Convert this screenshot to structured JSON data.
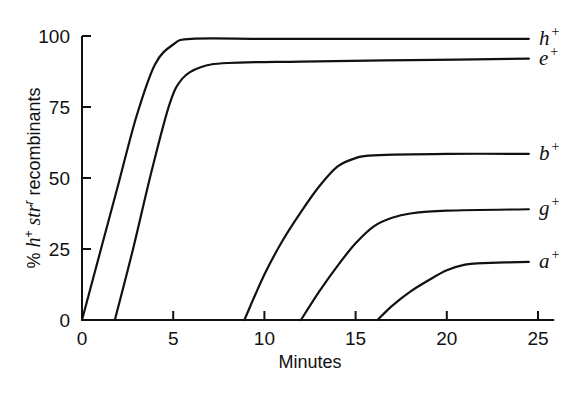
{
  "chart_data": {
    "type": "line",
    "title": "",
    "xlabel": "Minutes",
    "ylabel": "% h+ str r recombinants",
    "ylabel_parts": [
      {
        "text": "% ",
        "style": "normal"
      },
      {
        "text": "h",
        "style": "italic"
      },
      {
        "text": "+",
        "style": "sup"
      },
      {
        "text": " str",
        "style": "italic"
      },
      {
        "text": "r",
        "style": "sup-italic"
      },
      {
        "text": " recombinants",
        "style": "normal"
      }
    ],
    "xlim": [
      0,
      26
    ],
    "ylim": [
      0,
      100
    ],
    "xticks": [
      0,
      5,
      10,
      15,
      20,
      25
    ],
    "yticks": [
      0,
      25,
      50,
      75,
      100
    ],
    "xtick_labels": [
      "0",
      "5",
      "10",
      "15",
      "20",
      "25"
    ],
    "ytick_labels": [
      "0",
      "25",
      "50",
      "75",
      "100"
    ],
    "grid": false,
    "legend": "inline labels at right end of each curve",
    "series": [
      {
        "name": "h+",
        "label": "h",
        "sup": "+",
        "entry_time": 0,
        "plateau": 99,
        "points": [
          [
            0,
            0
          ],
          [
            1,
            24
          ],
          [
            2,
            48
          ],
          [
            3,
            72
          ],
          [
            4,
            90
          ],
          [
            5,
            97
          ],
          [
            6,
            99
          ],
          [
            10,
            99
          ],
          [
            15,
            99
          ],
          [
            20,
            99
          ],
          [
            24.5,
            99
          ]
        ]
      },
      {
        "name": "e+",
        "label": "e",
        "sup": "+",
        "entry_time": 1.8,
        "plateau": 91,
        "points": [
          [
            1.8,
            0
          ],
          [
            2.8,
            25
          ],
          [
            3.8,
            52
          ],
          [
            4.8,
            76
          ],
          [
            5.5,
            85
          ],
          [
            6.5,
            89
          ],
          [
            8,
            90.5
          ],
          [
            12,
            91
          ],
          [
            18,
            91.5
          ],
          [
            24.5,
            92
          ]
        ]
      },
      {
        "name": "b+",
        "label": "b",
        "sup": "+",
        "entry_time": 8.9,
        "plateau": 58,
        "points": [
          [
            8.9,
            0
          ],
          [
            10,
            16
          ],
          [
            11,
            28
          ],
          [
            12,
            38
          ],
          [
            13,
            47
          ],
          [
            14,
            54
          ],
          [
            15,
            57
          ],
          [
            16,
            58
          ],
          [
            20,
            58.5
          ],
          [
            24.5,
            58.5
          ]
        ]
      },
      {
        "name": "g+",
        "label": "g",
        "sup": "+",
        "entry_time": 12,
        "plateau": 39,
        "points": [
          [
            12,
            0
          ],
          [
            13,
            10
          ],
          [
            14,
            19
          ],
          [
            15,
            27
          ],
          [
            16,
            33
          ],
          [
            17,
            36
          ],
          [
            18,
            37.5
          ],
          [
            20,
            38.5
          ],
          [
            24.5,
            39
          ]
        ]
      },
      {
        "name": "a+",
        "label": "a",
        "sup": "+",
        "entry_time": 16.2,
        "plateau": 20,
        "points": [
          [
            16.2,
            0
          ],
          [
            17,
            5
          ],
          [
            18,
            10
          ],
          [
            19,
            14
          ],
          [
            20,
            17.5
          ],
          [
            21,
            19.5
          ],
          [
            22,
            20
          ],
          [
            24.5,
            20.5
          ]
        ]
      }
    ]
  }
}
